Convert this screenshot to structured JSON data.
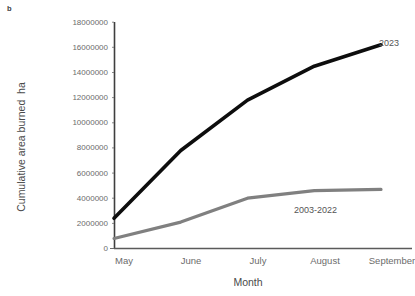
{
  "panel": {
    "label": "b"
  },
  "axes": {
    "ylabel": "Cumulative area burned  ha",
    "xlabel": "Month",
    "yticks": [
      "0",
      "2000000",
      "4000000",
      "6000000",
      "8000000",
      "10000000",
      "12000000",
      "14000000",
      "16000000",
      "18000000"
    ],
    "xticks": [
      "May",
      "June",
      "July",
      "August",
      "September"
    ]
  },
  "series_labels": {
    "current": "2023",
    "historic": "2003-2022"
  },
  "colors": {
    "current_line": "#0d0d0d",
    "historic_line": "#808080",
    "axis": "#3f3f3f",
    "tick_text": "#6b6b6b"
  },
  "chart_data": {
    "type": "line",
    "title": "",
    "xlabel": "Month",
    "ylabel": "Cumulative area burned  ha",
    "categories": [
      "May",
      "June",
      "July",
      "August",
      "September"
    ],
    "ylim": [
      0,
      18000000
    ],
    "ytick_step": 2000000,
    "grid": false,
    "legend": "direct-labels-at-line-ends",
    "series": [
      {
        "name": "2023",
        "color": "#0d0d0d",
        "values": [
          2400000,
          7800000,
          11800000,
          14500000,
          16200000
        ]
      },
      {
        "name": "2003-2022",
        "color": "#808080",
        "values": [
          800000,
          2100000,
          4000000,
          4600000,
          4700000
        ]
      }
    ]
  }
}
